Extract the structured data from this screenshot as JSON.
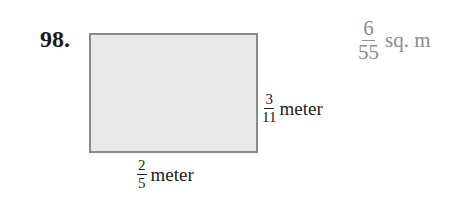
{
  "problem": {
    "marker_icon": "triangle-outline",
    "number": "98.",
    "figure": {
      "shape": "rectangle",
      "fill_color": "#e9e9e9",
      "border_color": "#8a8a8a",
      "height_label": {
        "numerator": "3",
        "denominator": "11",
        "unit": "meter"
      },
      "width_label": {
        "numerator": "2",
        "denominator": "5",
        "unit": "meter"
      }
    },
    "answer": {
      "numerator": "6",
      "denominator": "55",
      "unit": "sq. m"
    }
  }
}
